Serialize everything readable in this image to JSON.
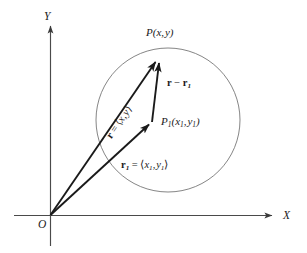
{
  "figure": {
    "background_color": "#ffffff",
    "stroke_color": "#1a1a1a",
    "circle_stroke_color": "#6b6b6b",
    "axis_stroke_color": "#4a4a4a"
  },
  "axes": {
    "x_label": "X",
    "y_label": "Y",
    "origin_label": "O"
  },
  "points": [
    {
      "id": "P",
      "label_main": "P",
      "label_args": "(x, y)",
      "x": 158,
      "y": 57
    },
    {
      "id": "P1",
      "label_main": "P",
      "label_sub": "1",
      "label_args": "(x",
      "label_args_sub1": "1",
      "label_args_mid": ", y",
      "label_args_sub2": "1",
      "label_args_end": ")",
      "x": 152,
      "y": 122
    }
  ],
  "labels": {
    "point_P": "P(x, y)",
    "point_P1": "P1(x1, y1)",
    "vector_r_minus_r1": "r − r1",
    "vector_r": "r = <x, y>",
    "vector_r1": "r1 = <x1, y1>"
  },
  "glyphs": {
    "minus": "−",
    "equals": "=",
    "angle_open": "⟨",
    "angle_close": "⟩",
    "comma": ","
  },
  "vectors": [
    {
      "name": "r",
      "from": "O",
      "to": "P",
      "label": "r = <x, y>"
    },
    {
      "name": "r1",
      "from": "O",
      "to": "P1",
      "label": "r1 = <x1, y1>"
    },
    {
      "name": "r-r1",
      "from": "P1",
      "to": "P",
      "label": "r − r1"
    }
  ],
  "circle": {
    "center_x": 168,
    "center_y": 120,
    "radius": 72
  }
}
